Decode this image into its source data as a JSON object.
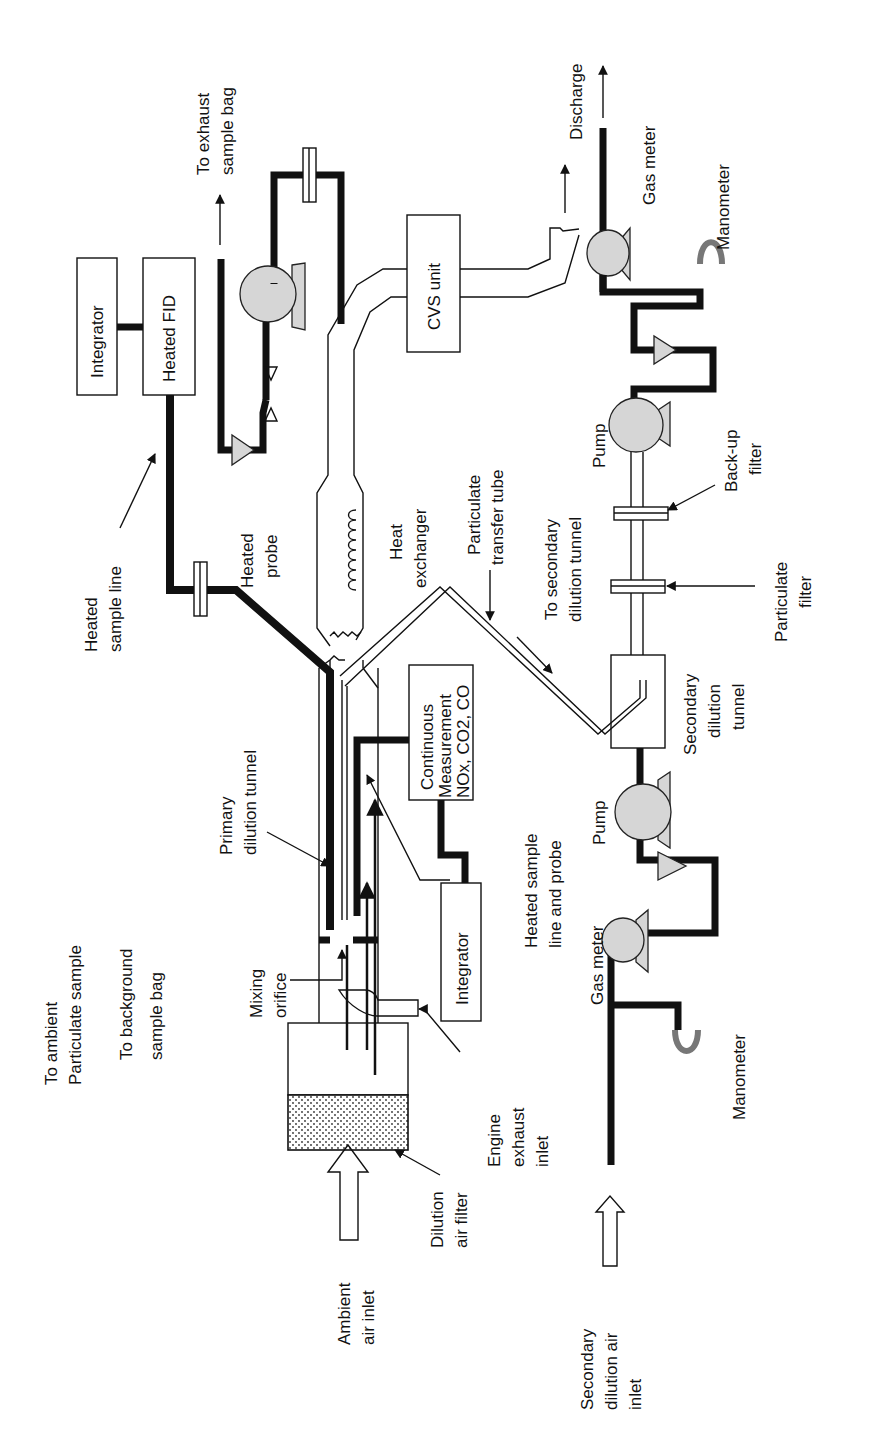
{
  "diagram": {
    "orientation": "rotated -90deg (text reads bottom-to-top)",
    "labels": {
      "to_exhaust_bag_1": "To exhaust",
      "to_exhaust_bag_2": "sample bag",
      "integrator_top": "Integrator",
      "heated_fid": "Heated FID",
      "cvs_unit": "CVS unit",
      "discharge": "Discharge",
      "gas_meter_top": "Gas meter",
      "manometer_top": "Manometer",
      "heated_sample_line_1": "Heated",
      "heated_sample_line_2": "sample line",
      "heated_probe_1": "Heated",
      "heated_probe_2": "probe",
      "heat_exchanger_1": "Heat",
      "heat_exchanger_2": "exchanger",
      "particulate_transfer_1": "Particulate",
      "particulate_transfer_2": "transfer tube",
      "to_secondary_1": "To secondary",
      "to_secondary_2": "dilution tunnel",
      "pump_top": "Pump",
      "backup_filter_1": "Back-up",
      "backup_filter_2": "filter",
      "particulate_filter_1": "Particulate",
      "particulate_filter_2": "filter",
      "continuous_1": "Continuous",
      "continuous_2": "Measurement",
      "continuous_3": "NOx, CO2, CO",
      "secondary_tunnel_1": "Secondary",
      "secondary_tunnel_2": "dilution",
      "secondary_tunnel_3": "tunnel",
      "primary_tunnel_1": "Primary",
      "primary_tunnel_2": "dilution tunnel",
      "pump_bottom": "Pump",
      "integrator_bottom": "Integrator",
      "heated_sample_probe_1": "Heated sample",
      "heated_sample_probe_2": "line and probe",
      "gas_meter_bottom": "Gas meter",
      "manometer_bottom": "Manometer",
      "to_ambient_1": "To ambient",
      "to_ambient_2": "Particulate sample",
      "to_background_1": "To background",
      "to_background_2": "sample bag",
      "mixing_orifice_1": "Mixing",
      "mixing_orifice_2": "orifice",
      "engine_exhaust_1": "Engine",
      "engine_exhaust_2": "exhaust",
      "engine_exhaust_3": "inlet",
      "dilution_filter_1": "Dilution",
      "dilution_filter_2": "air filter",
      "ambient_inlet_1": "Ambient",
      "ambient_inlet_2": "air inlet",
      "secondary_inlet_1": "Secondary",
      "secondary_inlet_2": "dilution air",
      "secondary_inlet_3": "inlet"
    },
    "colors": {
      "line": "#111111",
      "component_fill": "#d6d6d6",
      "manometer": "#777777"
    }
  }
}
